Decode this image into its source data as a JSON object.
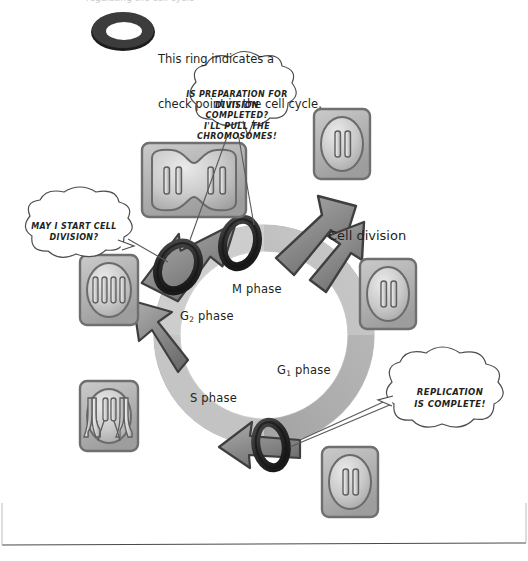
{
  "figure": {
    "title_cut_off": "regulating the cell cycle",
    "legend": {
      "icon_name": "checkpoint-ring",
      "line1": "This ring indicates a",
      "line2": "check point in the cell cycle."
    },
    "cycle_label": "Cell division",
    "phases": [
      {
        "id": "m",
        "label": "M phase",
        "sub": ""
      },
      {
        "id": "g2",
        "label": "G",
        "sub": "2",
        "suffix": " phase"
      },
      {
        "id": "g1",
        "label": "G",
        "sub": "1",
        "suffix": " phase"
      },
      {
        "id": "s",
        "label": "S phase",
        "sub": ""
      }
    ],
    "phase_text": {
      "m": "M phase",
      "g2_base": "G",
      "g2_sub": "2",
      "g2_suffix": " phase",
      "g1_base": "G",
      "g1_sub": "1",
      "g1_suffix": " phase",
      "s": "S phase"
    },
    "speech_bubbles": [
      {
        "id": "m-checkpoint",
        "shape": "cloud",
        "text": "IS PREPARATION FOR\nDIVISION COMPLETED?\nI'LL PULL THE\nCHROMOSOMES!"
      },
      {
        "id": "g1-checkpoint",
        "shape": "cloud",
        "text": "MAY I START CELL\nDIVISION?"
      },
      {
        "id": "g2-checkpoint",
        "shape": "cloud",
        "text": "REPLICATION\nIS COMPLETE!"
      }
    ],
    "cells": [
      {
        "id": "cell-telophase",
        "name": "dividing-cell-two-lobes",
        "chromosomes": 4,
        "form": "dumbbell"
      },
      {
        "id": "cell-daughter-top",
        "name": "daughter-cell-top",
        "chromosomes": 2,
        "form": "oval"
      },
      {
        "id": "cell-g1-right",
        "name": "g1-cell-right",
        "chromosomes": 2,
        "form": "oval"
      },
      {
        "id": "cell-daughter-bottom",
        "name": "daughter-cell-bottom",
        "chromosomes": 2,
        "form": "oval"
      },
      {
        "id": "cell-s-phase",
        "name": "s-phase-cell-replication-forks",
        "chromosomes": 2,
        "form": "oval-forks"
      },
      {
        "id": "cell-g2-left",
        "name": "g2-cell-four-chromosomes",
        "chromosomes": 4,
        "form": "oval"
      }
    ],
    "checkpoints": [
      {
        "id": "checkpoint-g1",
        "position": "g1-to-s"
      },
      {
        "id": "checkpoint-m",
        "position": "g2-to-m"
      },
      {
        "id": "checkpoint-g2",
        "position": "s-to-g2"
      }
    ],
    "colors": {
      "ink": "#231f20",
      "ring_dark": "#3a3a3a",
      "arrow_fill": "#8a8a8a",
      "cycle_light": "#d9d9d9",
      "cycle_mid": "#bdbdbd",
      "cycle_dark": "#9a9a9a",
      "cell_box": "#b5b5b5",
      "cell_body": "#cfcfcf",
      "bubble_fill": "#ffffff",
      "page_bg": "#ffffff"
    }
  }
}
